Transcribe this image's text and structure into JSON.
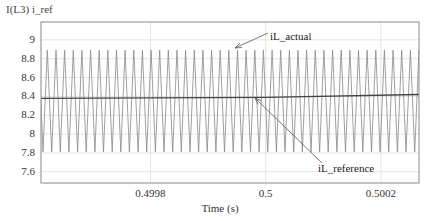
{
  "chart_data": {
    "type": "line",
    "title": "I(L3) i_ref",
    "xlabel": "Time (s)",
    "ylabel": "",
    "xlim": [
      0.49961,
      0.500266
    ],
    "ylim": [
      7.48,
      9.19
    ],
    "grid": true,
    "x_ticks": [
      {
        "value": 0.4998,
        "label": "0.4998"
      },
      {
        "value": 0.5,
        "label": "0.5"
      },
      {
        "value": 0.5002,
        "label": "0.5002"
      }
    ],
    "y_ticks": [
      {
        "value": 9.0,
        "label": "9"
      },
      {
        "value": 8.8,
        "label": "8.8"
      },
      {
        "value": 8.6,
        "label": "8.6"
      },
      {
        "value": 8.4,
        "label": "8.4"
      },
      {
        "value": 8.2,
        "label": "8.2"
      },
      {
        "value": 8.0,
        "label": "8"
      },
      {
        "value": 7.8,
        "label": "7.8"
      },
      {
        "value": 7.6,
        "label": "7.6"
      }
    ],
    "series": [
      {
        "name": "iL_actual",
        "shape": "triangle-wave",
        "peak": 8.89,
        "valley": 7.81,
        "period_s": 1.5e-05,
        "first_peak_t": 0.499621,
        "color": "#888888"
      },
      {
        "name": "iL_reference",
        "shape": "near-constant",
        "x": [
          0.49961,
          0.5,
          0.500266
        ],
        "values": [
          8.38,
          8.39,
          8.42
        ],
        "color": "#444444"
      }
    ],
    "annotations": [
      {
        "text": "iL_actual",
        "target_series": "iL_actual",
        "text_pos": [
          270,
          40
        ],
        "arrow_from": [
          268,
          33
        ],
        "arrow_to": [
          235,
          48
        ]
      },
      {
        "text": "iL_reference",
        "target_series": "iL_reference",
        "text_pos": [
          318,
          172
        ],
        "arrow_from": [
          322,
          163
        ],
        "arrow_to": [
          255,
          98
        ]
      }
    ]
  }
}
